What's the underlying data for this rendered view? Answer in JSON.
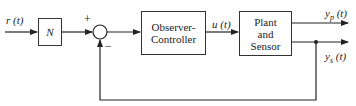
{
  "diagram": {
    "type": "block-diagram",
    "input": {
      "label": "r (t)"
    },
    "blocks": [
      {
        "id": "gain",
        "label": "N"
      },
      {
        "id": "observer_controller",
        "label_line1": "Observer-",
        "label_line2": "Controller"
      },
      {
        "id": "plant",
        "label_line1": "Plant",
        "label_line2": "and",
        "label_line3": "Sensor"
      }
    ],
    "summing_junction": {
      "plus_sign": "+",
      "minus_sign": "−"
    },
    "signals": {
      "control": "u (t)",
      "output_plant": "y_p (t)",
      "output_sensor": "y_s (t)",
      "yp_main": "y",
      "yp_sub": "p",
      "yp_tail": " (t)",
      "ys_main": "y",
      "ys_sub": "s",
      "ys_tail": " (t)"
    },
    "feedback": "y_s (t) fed back to summing junction (negative)"
  }
}
